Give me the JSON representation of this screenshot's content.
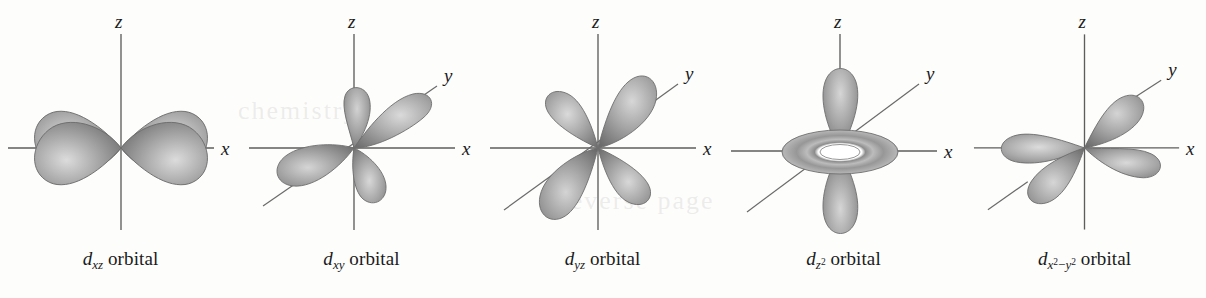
{
  "figure": {
    "kind": "d-orbital-shapes-diagram",
    "background_color": "#fdfdfc",
    "axis_color": "#5d5d5d",
    "lobe_fill_dark": "#6f6f6f",
    "lobe_fill_light": "#c9c9c9",
    "text_color": "#1a1a1a",
    "panel_count": 5
  },
  "panels": [
    {
      "id": "dxz",
      "caption": {
        "symbol": "d",
        "subscript": "xz",
        "word": "orbital",
        "full_text": "dxz orbital"
      },
      "axes": [
        {
          "name": "z",
          "label": "z",
          "orientation": "vertical"
        },
        {
          "name": "x",
          "label": "x",
          "orientation": "horizontal"
        }
      ],
      "lobe_count": 4,
      "lobe_arrangement": "four lobes between x and z axes at 45 degrees",
      "has_torus": false
    },
    {
      "id": "dxy",
      "caption": {
        "symbol": "d",
        "subscript": "xy",
        "word": "orbital",
        "full_text": "dxy orbital"
      },
      "axes": [
        {
          "name": "z",
          "label": "z",
          "orientation": "vertical"
        },
        {
          "name": "x",
          "label": "x",
          "orientation": "horizontal"
        },
        {
          "name": "y",
          "label": "y",
          "orientation": "diagonal"
        }
      ],
      "lobe_count": 4,
      "lobe_arrangement": "four lobes between x and y axes, shown in perspective",
      "has_torus": false
    },
    {
      "id": "dyz",
      "caption": {
        "symbol": "d",
        "subscript": "yz",
        "word": "orbital",
        "full_text": "dyz orbital"
      },
      "axes": [
        {
          "name": "z",
          "label": "z",
          "orientation": "vertical"
        },
        {
          "name": "x",
          "label": "x",
          "orientation": "horizontal"
        },
        {
          "name": "y",
          "label": "y",
          "orientation": "diagonal"
        }
      ],
      "lobe_count": 4,
      "lobe_arrangement": "four lobes between y and z axes, shown in perspective",
      "has_torus": false
    },
    {
      "id": "dz2",
      "caption": {
        "symbol": "d",
        "subscript": "z",
        "subscript_sup": "2",
        "word": "orbital",
        "full_text": "dz2 orbital"
      },
      "axes": [
        {
          "name": "z",
          "label": "z",
          "orientation": "vertical"
        },
        {
          "name": "x",
          "label": "x",
          "orientation": "horizontal"
        },
        {
          "name": "y",
          "label": "y",
          "orientation": "diagonal"
        }
      ],
      "lobe_count": 2,
      "lobe_arrangement": "two lobes along the z axis with a torus around the origin",
      "has_torus": true
    },
    {
      "id": "dx2y2",
      "caption": {
        "symbol": "d",
        "sub_x": "x",
        "sub_x_sup": "2",
        "minus": "−",
        "sub_y": "y",
        "sub_y_sup": "2",
        "word": "orbital",
        "full_text": "dx2-y2 orbital"
      },
      "axes": [
        {
          "name": "z",
          "label": "z",
          "orientation": "vertical"
        },
        {
          "name": "x",
          "label": "x",
          "orientation": "horizontal"
        },
        {
          "name": "y",
          "label": "y",
          "orientation": "diagonal"
        }
      ],
      "lobe_count": 4,
      "lobe_arrangement": "four lobes along the x and y axes, shown in perspective",
      "has_torus": false
    }
  ],
  "ghost_texts": [
    {
      "text": "chemistry",
      "left": 238,
      "top": 96
    },
    {
      "text": "reverse page",
      "left": 560,
      "top": 186
    }
  ]
}
